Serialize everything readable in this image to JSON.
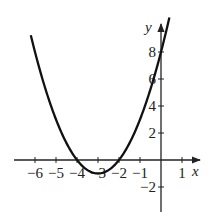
{
  "chart_data": {
    "type": "line",
    "title": "",
    "function": "y = x^2 + 6x + 8",
    "xlabel": "x",
    "ylabel": "y",
    "xlim": [
      -7,
      2
    ],
    "ylim": [
      -3,
      9.5
    ],
    "grid": false,
    "x_ticks": [
      -6,
      -5,
      -4,
      -3,
      -2,
      -1,
      1
    ],
    "x_tick_labels": [
      "−6",
      "−5",
      "−4",
      "−3",
      "−2",
      "−1",
      "1"
    ],
    "y_ticks": [
      -2,
      2,
      4,
      6,
      8
    ],
    "y_tick_labels": [
      "−2",
      "2",
      "4",
      "6",
      "8"
    ],
    "series": [
      {
        "name": "parabola",
        "x": [
          -6.5,
          -6,
          -5,
          -4,
          -3,
          -2,
          -1,
          0,
          0.3
        ],
        "y": [
          12.25,
          8,
          3,
          0,
          -1,
          0,
          3,
          8,
          9.89
        ]
      }
    ],
    "annotations": {
      "vertex": [
        -3,
        -1
      ],
      "x_intercepts": [
        -4,
        -2
      ],
      "y_intercept": 8
    },
    "color": "#111111"
  }
}
